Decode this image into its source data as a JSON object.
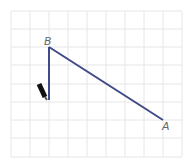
{
  "diagram": {
    "type": "grid-geometry",
    "grid": {
      "cols": 9,
      "rows": 8,
      "cell_size": 19,
      "origin_x": 11,
      "origin_y": 11,
      "line_color": "#e6e6e6"
    },
    "points": [
      {
        "label": "B",
        "x": 49,
        "y": 47
      },
      {
        "label": "A",
        "x": 163,
        "y": 120
      }
    ],
    "segments": [
      {
        "from": "B",
        "to": "A",
        "color": "#3f4a87"
      },
      {
        "from": "B",
        "to": "bottom",
        "color": "#3f4a87"
      }
    ],
    "vertical_end": {
      "x": 49,
      "y": 100
    },
    "pencil": {
      "color": "#111111"
    },
    "labels": {
      "a": "A",
      "b": "B"
    }
  }
}
